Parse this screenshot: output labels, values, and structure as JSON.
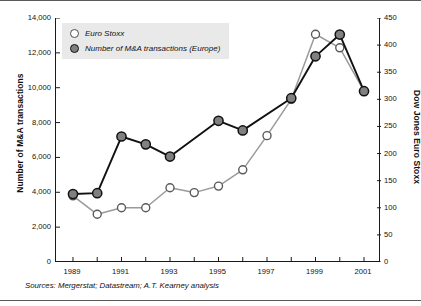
{
  "figure": {
    "source_note": "Sources: Mergerstat; Datastream; A.T. Kearney analysis"
  },
  "legend": {
    "items": [
      {
        "label": "Euro Stoxx",
        "marker": "open-circle-marker"
      },
      {
        "label": "Number of M&A transactions (Europe)",
        "marker": "filled-circle-marker"
      }
    ]
  },
  "axes": {
    "left": {
      "title": "Number of M&A transactions",
      "ticks": [
        "0",
        "2,000",
        "4,000",
        "6,000",
        "8,000",
        "10,000",
        "12,000",
        "14,000"
      ],
      "tick_values": [
        0,
        2000,
        4000,
        6000,
        8000,
        10000,
        12000,
        14000
      ],
      "min": 0,
      "max": 14000
    },
    "right": {
      "title": "Dow Jones Euro Stoxx",
      "ticks": [
        "0",
        "50",
        "100",
        "150",
        "200",
        "250",
        "300",
        "350",
        "400",
        "450"
      ],
      "tick_values": [
        0,
        50,
        100,
        150,
        200,
        250,
        300,
        350,
        400,
        450
      ],
      "min": 0,
      "max": 450
    },
    "bottom": {
      "title": "",
      "ticks": [
        "1989",
        "1991",
        "1993",
        "1995",
        "1997",
        "1999",
        "2001"
      ],
      "all_years": [
        1989,
        1990,
        1991,
        1992,
        1993,
        1994,
        1995,
        1996,
        1997,
        1998,
        1999,
        2000,
        2001
      ],
      "min": 1989,
      "max": 2001
    }
  },
  "colors": {
    "mna_line": "#111111",
    "mna_marker_fill": "#808080",
    "stoxx_line": "#9a9a9a",
    "stoxx_marker_fill": "#ffffff",
    "legend_background": "#e9e9e9",
    "frame": "#1a1a1a"
  },
  "chart_data": {
    "type": "line",
    "title": "",
    "subtitle": "",
    "xlabel": "",
    "ylabel": "Number of M&A transactions",
    "y2label": "Dow Jones Euro Stoxx",
    "x": [
      1989,
      1990,
      1991,
      1992,
      1993,
      1994,
      1995,
      1996,
      1997,
      1998,
      1999,
      2000,
      2001
    ],
    "xlim": [
      1988.3,
      2001.7
    ],
    "ylim": [
      0,
      14000
    ],
    "y2lim": [
      0,
      450
    ],
    "grid": false,
    "legend_position": "upper-left-inside",
    "series": [
      {
        "name": "Number of M&A transactions (Europe)",
        "axis": "left",
        "marker": "filled-circle",
        "line_color": "#111111",
        "x": [
          1989,
          1990,
          1991,
          1992,
          1993,
          1995,
          1996,
          1998,
          1999,
          2000,
          2001
        ],
        "values": [
          3900,
          3950,
          7200,
          6750,
          6050,
          8100,
          7550,
          9400,
          11800,
          13050,
          9800
        ]
      },
      {
        "name": "Euro Stoxx",
        "axis": "right",
        "marker": "open-circle",
        "line_color": "#9a9a9a",
        "x": [
          1989,
          1990,
          1991,
          1992,
          1993,
          1994,
          1995,
          1996,
          1997,
          1998,
          1999,
          2000,
          2001
        ],
        "values": [
          122,
          88,
          100,
          100,
          137,
          128,
          140,
          170,
          233,
          300,
          420,
          395,
          315
        ]
      }
    ]
  }
}
